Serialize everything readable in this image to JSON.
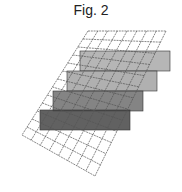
{
  "figure": {
    "title": "Fig. 2"
  },
  "grid": {
    "corners": {
      "top_left": [
        88,
        31
      ],
      "top_right": [
        166,
        31
      ],
      "bottom_right": [
        95,
        176
      ],
      "bottom_left": [
        22,
        135
      ]
    },
    "cols": 8,
    "rows": 13,
    "line_color": "#555555"
  },
  "layers": [
    {
      "name": "layer-1",
      "x": 80,
      "y": 51,
      "width": 90,
      "height": 20,
      "fill": "#a9a9a9"
    },
    {
      "name": "layer-2",
      "x": 67,
      "y": 71,
      "width": 90,
      "height": 20,
      "fill": "#a2a2a2"
    },
    {
      "name": "layer-3",
      "x": 53,
      "y": 91,
      "width": 90,
      "height": 20,
      "fill": "#6e6e6e"
    },
    {
      "name": "layer-4",
      "x": 40,
      "y": 110,
      "width": 90,
      "height": 20,
      "fill": "#454545"
    }
  ]
}
